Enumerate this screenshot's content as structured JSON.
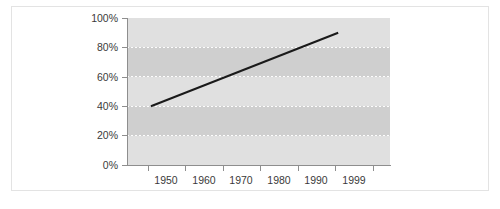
{
  "figure": {
    "caption": "",
    "frame_color": "#e3e3e3",
    "background": "#ffffff"
  },
  "chart_data": {
    "type": "line",
    "title": "",
    "subtitle": "",
    "xlabel": "",
    "ylabel": "",
    "x": [
      1950,
      1999
    ],
    "series": [
      {
        "name": "Trend",
        "x": [
          1950,
          1997
        ],
        "values": [
          40,
          90
        ],
        "color": "#1a1a1a",
        "line_width": 2
      }
    ],
    "x_tick_labels": [
      "1950",
      "1960",
      "1970",
      "1980",
      "1990",
      "1999"
    ],
    "x_tick_values": [
      1950,
      1960,
      1970,
      1980,
      1990,
      1999
    ],
    "y_tick_labels": [
      "0%",
      "20%",
      "40%",
      "60%",
      "80%",
      "100%"
    ],
    "y_tick_values": [
      0,
      20,
      40,
      60,
      80,
      100
    ],
    "xlim": [
      1944,
      2010
    ],
    "ylim": [
      0,
      100
    ],
    "grid": true,
    "gridline_style": "dotted-white-horizontal",
    "gridline_values": [
      20,
      40,
      60,
      80
    ],
    "legend": "none",
    "plot_bands": [
      {
        "from": 0,
        "to": 20,
        "color": "#e0e0e0"
      },
      {
        "from": 20,
        "to": 40,
        "color": "#cfcfcf"
      },
      {
        "from": 40,
        "to": 60,
        "color": "#e0e0e0"
      },
      {
        "from": 60,
        "to": 80,
        "color": "#cfcfcf"
      },
      {
        "from": 80,
        "to": 100,
        "color": "#e0e0e0"
      }
    ],
    "plot_background": "#d9d9d9",
    "axis_color": "#8e8e8e",
    "tick_label_color": "#3a3a3a"
  }
}
